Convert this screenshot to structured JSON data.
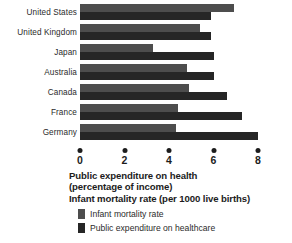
{
  "chart_data": {
    "type": "bar",
    "orientation": "horizontal",
    "title": "Public expenditure on health (percentage of income) Infant mortality rate (per 1000 live births)",
    "title_lines": [
      "Public expenditure on health",
      "(percentage of income)",
      "Infant mortality rate (per 1000 live births)"
    ],
    "categories": [
      "United States",
      "United Kingdom",
      "Japan",
      "Australia",
      "Canada",
      "France",
      "Germany"
    ],
    "series": [
      {
        "name": "Infant mortality rate",
        "color": "#4d4d4d",
        "values": [
          6.9,
          5.4,
          3.3,
          4.8,
          4.9,
          4.4,
          4.3
        ]
      },
      {
        "name": "Public expenditure on healthcare",
        "color": "#262626",
        "values": [
          5.9,
          5.9,
          6.0,
          6.0,
          6.6,
          7.3,
          8.0
        ]
      }
    ],
    "xlabel": "",
    "ylabel": "",
    "xlim": [
      0,
      8
    ],
    "xticks": [
      0,
      2,
      4,
      6,
      8
    ],
    "xtick_labels": [
      "0",
      "2",
      "4",
      "6",
      "8"
    ],
    "grid": false,
    "legend_position": "bottom-left",
    "legend": [
      {
        "label": "Infant mortality rate",
        "color": "#4d4d4d"
      },
      {
        "label": "Public expenditure on healthcare",
        "color": "#262626"
      }
    ]
  },
  "axis": {
    "ticks": [
      {
        "value": 0,
        "label": "0"
      },
      {
        "value": 2,
        "label": "2"
      },
      {
        "value": 4,
        "label": "4"
      },
      {
        "value": 6,
        "label": "6"
      },
      {
        "value": 8,
        "label": "8"
      }
    ]
  },
  "groups": [
    {
      "category": "United States",
      "light": 6.9,
      "dark": 5.9
    },
    {
      "category": "United Kingdom",
      "light": 5.4,
      "dark": 5.9
    },
    {
      "category": "Japan",
      "light": 3.3,
      "dark": 6.0
    },
    {
      "category": "Australia",
      "light": 4.8,
      "dark": 6.0
    },
    {
      "category": "Canada",
      "light": 4.9,
      "dark": 6.6
    },
    {
      "category": "France",
      "light": 4.4,
      "dark": 7.3
    },
    {
      "category": "Germany",
      "light": 4.3,
      "dark": 8.0
    }
  ]
}
